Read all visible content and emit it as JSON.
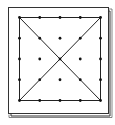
{
  "diagram": {
    "type": "geoboard",
    "grid": {
      "rows": 5,
      "cols": 5
    },
    "board_color": "#ffffff",
    "line_color": "#222222",
    "peg_color": "#111111",
    "shapes": [
      {
        "name": "square",
        "vertices": [
          [
            0,
            0
          ],
          [
            4,
            0
          ],
          [
            4,
            4
          ],
          [
            0,
            4
          ]
        ]
      },
      {
        "name": "diagonal-1",
        "vertices": [
          [
            0,
            0
          ],
          [
            4,
            4
          ]
        ]
      },
      {
        "name": "diagonal-2",
        "vertices": [
          [
            4,
            0
          ],
          [
            0,
            4
          ]
        ]
      }
    ]
  }
}
